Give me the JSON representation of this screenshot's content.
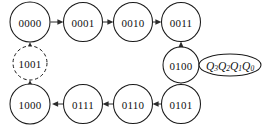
{
  "figure": {
    "background_color": "#ffffff",
    "stroke_color": "#1a1a1a",
    "arrow_color": "#2b2b2b"
  },
  "nodes": [
    {
      "id": "n0000",
      "label": "0000",
      "cx": 30,
      "cy": 22,
      "r": 20,
      "style": "solid"
    },
    {
      "id": "n0001",
      "label": "0001",
      "cx": 83,
      "cy": 22,
      "r": 19.5,
      "style": "solid"
    },
    {
      "id": "n0010",
      "label": "0010",
      "cx": 133,
      "cy": 22,
      "r": 19.5,
      "style": "solid"
    },
    {
      "id": "n0011",
      "label": "0011",
      "cx": 181,
      "cy": 22,
      "r": 19.5,
      "style": "solid"
    },
    {
      "id": "n0100",
      "label": "0100",
      "cx": 181,
      "cy": 65,
      "r": 18,
      "style": "solid"
    },
    {
      "id": "n0101",
      "label": "0101",
      "cx": 181,
      "cy": 104,
      "r": 19.5,
      "style": "solid"
    },
    {
      "id": "n0110",
      "label": "0110",
      "cx": 133,
      "cy": 104,
      "r": 19.5,
      "style": "solid"
    },
    {
      "id": "n0111",
      "label": "0111",
      "cx": 83,
      "cy": 104,
      "r": 19.5,
      "style": "solid"
    },
    {
      "id": "n1000",
      "label": "1000",
      "cx": 30,
      "cy": 104,
      "r": 20,
      "style": "solid"
    },
    {
      "id": "n1001",
      "label": "1001",
      "cx": 30,
      "cy": 63,
      "r": 17,
      "style": "dashed"
    }
  ],
  "edges": [
    {
      "id": "e1",
      "from": "0000",
      "to": "0001",
      "direction": "right"
    },
    {
      "id": "e2",
      "from": "0001",
      "to": "0010",
      "direction": "right"
    },
    {
      "id": "e3",
      "from": "0010",
      "to": "0011",
      "direction": "right"
    },
    {
      "id": "e4",
      "from": "0100",
      "to": "0011",
      "direction": "up"
    },
    {
      "id": "e5",
      "from": "0101",
      "to": "0100",
      "direction": "up"
    },
    {
      "id": "e6",
      "from": "0101",
      "to": "0110",
      "direction": "left"
    },
    {
      "id": "e7",
      "from": "0110",
      "to": "0111",
      "direction": "left"
    },
    {
      "id": "e8",
      "from": "0111",
      "to": "1000",
      "direction": "left"
    },
    {
      "id": "e9",
      "from": "1000",
      "to": "1001",
      "direction": "up"
    },
    {
      "id": "e10",
      "from": "1001",
      "to": "0000",
      "direction": "up"
    }
  ],
  "legend": {
    "shape": "ellipse",
    "cx": 230,
    "cy": 65,
    "rx": 31,
    "ry": 11,
    "symbols": [
      {
        "base": "Q",
        "sub": "3"
      },
      {
        "base": "Q",
        "sub": "2"
      },
      {
        "base": "Q",
        "sub": "1"
      },
      {
        "base": "Q",
        "sub": "0"
      }
    ],
    "text": "Q3Q2Q1Q0"
  }
}
